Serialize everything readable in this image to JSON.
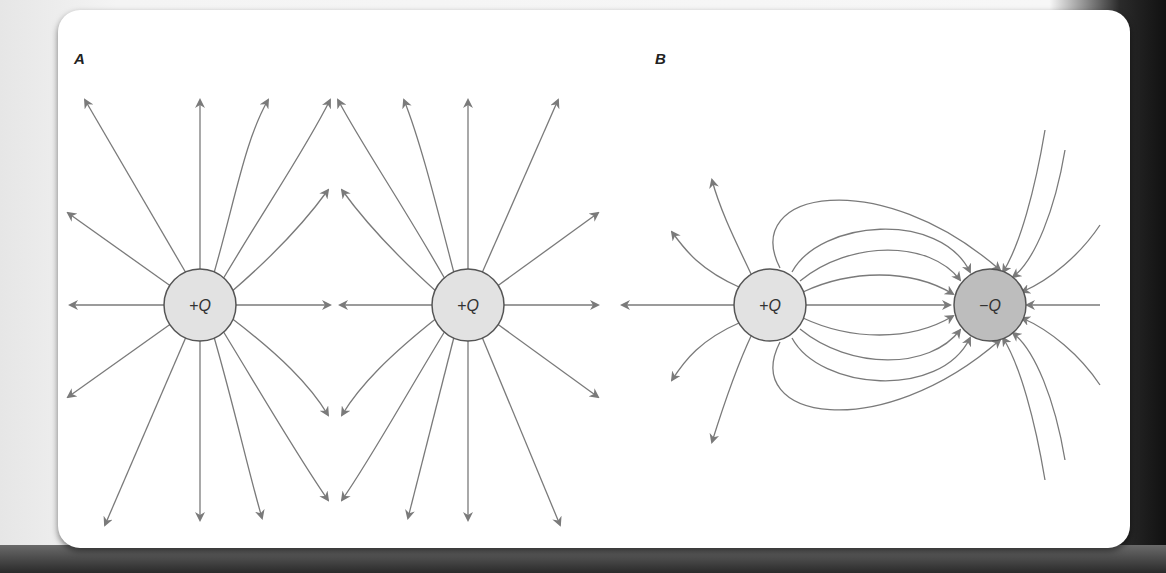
{
  "figure": {
    "panels": [
      {
        "label": "A",
        "charges": [
          {
            "label": "+Q",
            "sign": "positive",
            "cx": 200,
            "cy": 305
          },
          {
            "label": "+Q",
            "sign": "positive",
            "cx": 468,
            "cy": 305
          }
        ],
        "description": "Field lines of two equal positive charges repelling"
      },
      {
        "label": "B",
        "charges": [
          {
            "label": "+Q",
            "sign": "positive",
            "cx": 770,
            "cy": 305
          },
          {
            "label": "−Q",
            "sign": "negative",
            "cx": 990,
            "cy": 305
          }
        ],
        "description": "Field lines from a positive charge to a negative charge (dipole)"
      }
    ],
    "colors": {
      "line": "#7a7a7a",
      "positive_fill": "#e2e2e2",
      "negative_fill": "#bdbdbd",
      "outline": "#555555"
    }
  }
}
